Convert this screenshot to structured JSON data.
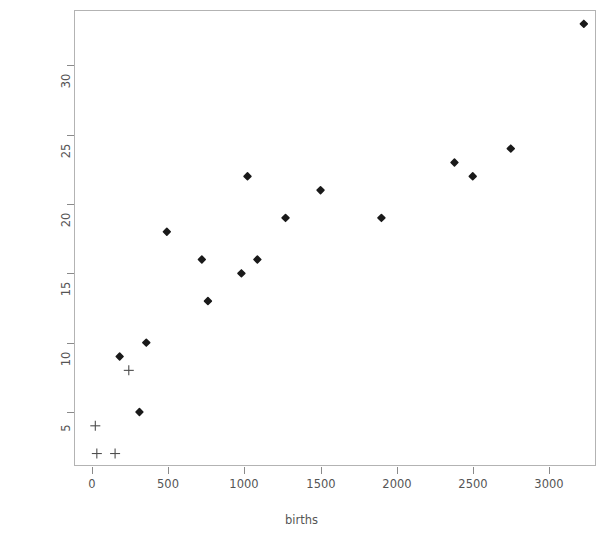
{
  "chart_data": {
    "type": "scatter",
    "title": "",
    "xlabel": "births",
    "ylabel": "caesareans",
    "xlim": [
      -120,
      3310
    ],
    "ylim": [
      1.1,
      34.0
    ],
    "grid": false,
    "legend": null,
    "x_ticks": [
      0,
      500,
      1000,
      1500,
      2000,
      2500,
      3000
    ],
    "x_tick_labels": [
      "0",
      "500",
      "1000",
      "1500",
      "2000",
      "2500",
      "3000"
    ],
    "y_ticks": [
      5,
      10,
      15,
      20,
      25,
      30
    ],
    "y_tick_labels": [
      "5",
      "10",
      "15",
      "20",
      "25",
      "30"
    ],
    "series": [
      {
        "name": "filled-diamond-points",
        "marker": "filled-diamond",
        "color": "#1a1a1a",
        "points": [
          {
            "x": 180,
            "y": 9
          },
          {
            "x": 310,
            "y": 5
          },
          {
            "x": 355,
            "y": 10
          },
          {
            "x": 490,
            "y": 18
          },
          {
            "x": 720,
            "y": 16
          },
          {
            "x": 760,
            "y": 13
          },
          {
            "x": 980,
            "y": 15
          },
          {
            "x": 1020,
            "y": 22
          },
          {
            "x": 1085,
            "y": 16
          },
          {
            "x": 1270,
            "y": 19
          },
          {
            "x": 1500,
            "y": 21
          },
          {
            "x": 1900,
            "y": 19
          },
          {
            "x": 2380,
            "y": 23
          },
          {
            "x": 2500,
            "y": 22
          },
          {
            "x": 2750,
            "y": 24
          },
          {
            "x": 3230,
            "y": 33
          }
        ]
      },
      {
        "name": "plus-points",
        "marker": "plus",
        "color": "#4d4d4d",
        "points": [
          {
            "x": 20,
            "y": 4
          },
          {
            "x": 30,
            "y": 2
          },
          {
            "x": 150,
            "y": 2
          },
          {
            "x": 240,
            "y": 8
          }
        ]
      }
    ],
    "colors": {
      "axis": "#b3b3b3",
      "tick": "#8a8a8a",
      "text": "#555555",
      "marker_filled": "#1a1a1a",
      "marker_plus": "#4d4d4d",
      "background": "#ffffff"
    }
  }
}
